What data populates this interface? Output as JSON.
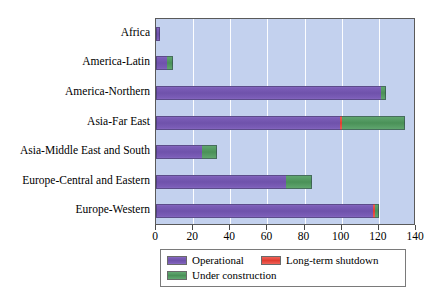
{
  "chart_data": {
    "type": "bar",
    "orientation": "horizontal",
    "stacked": true,
    "title": "",
    "xlabel": "",
    "ylabel": "",
    "xlim": [
      0,
      140
    ],
    "xticks": [
      0,
      20,
      40,
      60,
      80,
      100,
      120,
      140
    ],
    "xtick_labels": [
      "0",
      "20",
      "40",
      "60",
      "80",
      "100",
      "120",
      "140"
    ],
    "grid": "vertical-white-gridlines",
    "legend_position": "bottom-center",
    "categories": [
      "Africa",
      "America-Latin",
      "America-Northern",
      "Asia-Far East",
      "Asia-Middle East and South",
      "Europe-Central and Eastern",
      "Europe-Western"
    ],
    "series": [
      {
        "name": "Operational",
        "color": "#6f52ab",
        "values": [
          2,
          6,
          121,
          99,
          25,
          70,
          117
        ]
      },
      {
        "name": "Long-term shutdown",
        "color": "#e03c31",
        "values": [
          0,
          0,
          0,
          1,
          0,
          0,
          1
        ]
      },
      {
        "name": "Under construction",
        "color": "#4a9158",
        "values": [
          0,
          3,
          3,
          34,
          8,
          14,
          2
        ]
      }
    ]
  },
  "legend": {
    "items": [
      {
        "label": "Operational",
        "color": "#6f52ab",
        "swatch_name": "legend-swatch-operational"
      },
      {
        "label": "Long-term shutdown",
        "color": "#e03c31",
        "swatch_name": "legend-swatch-shutdown"
      },
      {
        "label": "Under construction",
        "color": "#4a9158",
        "swatch_name": "legend-swatch-construction"
      }
    ]
  },
  "plot": {
    "background_color": "#c3d1ee",
    "gridline_color": "#ffffff",
    "frame_color": "#5a5a5a"
  }
}
